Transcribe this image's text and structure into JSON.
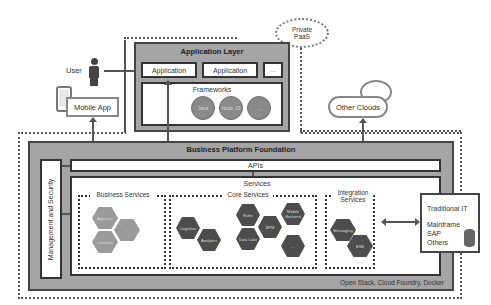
{
  "private_paas": {
    "label": "Private\nPaaS",
    "line1": "Private",
    "line2": "PaaS"
  },
  "user": {
    "label": "User"
  },
  "mobile_app": {
    "label": "Mobile App"
  },
  "application_layer": {
    "title": "Application Layer",
    "apps": [
      "Application",
      "Application",
      "..."
    ],
    "frameworks": {
      "title": "Frameworks",
      "items": [
        "Java",
        "Node JS",
        "..."
      ]
    }
  },
  "other_clouds": {
    "label": "Other Clouds"
  },
  "business_platform": {
    "title": "Business Platform Foundation",
    "apis": "APIs",
    "management": "Management and Security",
    "services": {
      "title": "Services",
      "business": {
        "title": "Business Services",
        "items": [
          "Approval",
          "Calendar",
          "..."
        ]
      },
      "core": {
        "title": "Core Services",
        "items": [
          "Cognitive",
          "Analytics",
          "Rules",
          "Data Lake",
          "BPM",
          "Mobile Backend",
          "..."
        ]
      },
      "integration": {
        "title": "Integration Services",
        "line1": "Integration",
        "line2": "Services",
        "items": [
          "Messaging",
          "ESB"
        ]
      }
    },
    "footer": "Open Stack, Cloud Foundry, Docker"
  },
  "traditional_it": {
    "title": "Traditional IT",
    "items": [
      "Mainframe",
      "SAP",
      "Others"
    ]
  },
  "colors": {
    "platform_gray": "#a5a5a5",
    "hex_light": "#9a9a9a",
    "hex_dark": "#4d4d4d",
    "circle": "#8a8a8a"
  }
}
